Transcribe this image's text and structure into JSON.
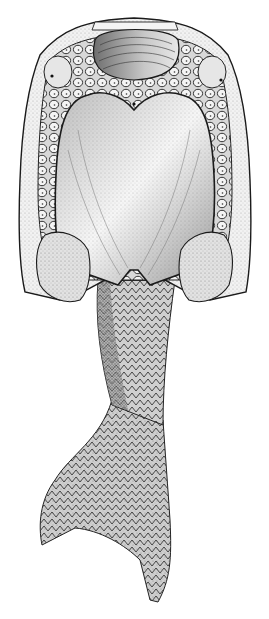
{
  "image": {
    "subject": "Stippled scientific illustration of an armored jawless fossil fish, ventral view",
    "width": 269,
    "height": 619,
    "background": "#ffffff",
    "ink": "#1a1a1a",
    "parts": [
      {
        "name": "oral-plate",
        "label": "Oral plate (ridged, top)"
      },
      {
        "name": "ventral-shield",
        "label": "Large heart-shaped ventral shield"
      },
      {
        "name": "tesserae-border",
        "label": "Polygonal small plates surrounding shield"
      },
      {
        "name": "lateral-orbits",
        "label": "Left and right orbit plates"
      },
      {
        "name": "pectoral-lobes",
        "label": "Left and right lower lateral lobes"
      },
      {
        "name": "scaled-trunk",
        "label": "Scaled tail trunk"
      },
      {
        "name": "caudal-fin",
        "label": "Hypocercal caudal fin"
      }
    ]
  }
}
